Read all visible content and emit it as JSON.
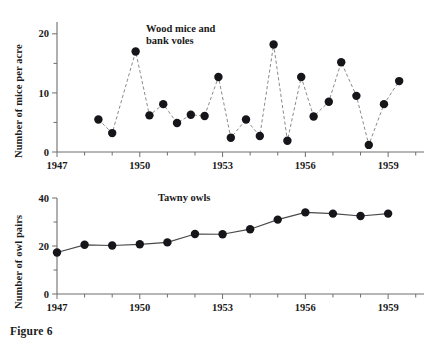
{
  "figure": {
    "caption": "Figure 6"
  },
  "chart_data": [
    {
      "type": "line",
      "id": "wood-mice-bank-voles",
      "title": "Wood mice and bank voles",
      "xlabel": "",
      "ylabel": "Number of mice per acre",
      "xlim": [
        1947,
        1960.3
      ],
      "ylim": [
        0,
        22
      ],
      "yticks": [
        0,
        10,
        20
      ],
      "ytick_labels": [
        "0",
        "10",
        "20"
      ],
      "yminor_ticks": [
        5,
        15
      ],
      "xticks": [
        1947,
        1950,
        1953,
        1956,
        1959
      ],
      "xtick_labels": [
        "1947",
        "1950",
        "1953",
        "1956",
        "1959"
      ],
      "xminor_ticks": [
        1948,
        1949,
        1951,
        1952,
        1954,
        1955,
        1957,
        1958,
        1960
      ],
      "grid": false,
      "legend": "none",
      "line_style": "dashed",
      "marker": "filled-circle",
      "x": [
        1948.5,
        1949.0,
        1949.85,
        1950.35,
        1950.85,
        1951.35,
        1951.85,
        1952.35,
        1952.85,
        1953.3,
        1953.85,
        1954.35,
        1954.85,
        1955.35,
        1955.85,
        1956.3,
        1956.85,
        1957.3,
        1957.85,
        1958.3,
        1958.85,
        1959.4
      ],
      "values": [
        5.5,
        3.2,
        17.0,
        6.2,
        8.1,
        4.9,
        6.3,
        6.1,
        12.7,
        2.4,
        5.5,
        2.7,
        18.2,
        1.9,
        12.7,
        6.0,
        8.5,
        15.2,
        9.5,
        1.2,
        8.1,
        12.0,
        21.0
      ],
      "y": [
        5.5,
        3.2,
        17.0,
        6.2,
        8.1,
        4.9,
        6.3,
        6.1,
        12.7,
        2.4,
        5.5,
        2.7,
        18.2,
        1.9,
        12.7,
        6.0,
        8.5,
        15.2,
        9.5,
        1.2,
        8.1,
        12.0,
        21.0
      ]
    },
    {
      "type": "line",
      "id": "tawny-owls",
      "title": "Tawny owls",
      "xlabel": "",
      "ylabel": "Number of owl pairs",
      "xlim": [
        1947,
        1960.3
      ],
      "ylim": [
        0,
        40
      ],
      "yticks": [
        0,
        20,
        40
      ],
      "ytick_labels": [
        "0",
        "20",
        "40"
      ],
      "yminor_ticks": [
        10,
        30
      ],
      "xticks": [
        1947,
        1950,
        1953,
        1956,
        1959
      ],
      "xtick_labels": [
        "1947",
        "1950",
        "1953",
        "1956",
        "1959"
      ],
      "xminor_ticks": [
        1948,
        1949,
        1951,
        1952,
        1954,
        1955,
        1957,
        1958,
        1960
      ],
      "grid": false,
      "legend": "none",
      "line_style": "solid",
      "marker": "filled-circle",
      "x": [
        1947,
        1948,
        1949,
        1950,
        1951,
        1952,
        1953,
        1954,
        1955,
        1956,
        1957,
        1958,
        1959
      ],
      "values": [
        17.3,
        20.5,
        20.2,
        20.7,
        21.5,
        25.0,
        24.9,
        27.0,
        31.0,
        34.0,
        33.5,
        32.5,
        33.5
      ],
      "y": [
        17.3,
        20.5,
        20.2,
        20.7,
        21.5,
        25.0,
        24.9,
        27.0,
        31.0,
        34.0,
        33.5,
        32.5,
        33.5
      ]
    }
  ],
  "colors": {
    "axis": "#6e6e6e",
    "marker": "#16161a",
    "line_top": "#8a8a8a",
    "line_bottom": "#4a4a4a",
    "text": "#1a1a1a",
    "background": "#ffffff"
  }
}
